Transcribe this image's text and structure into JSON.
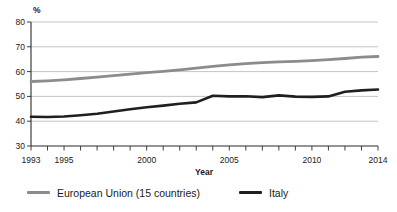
{
  "chart_data": {
    "type": "line",
    "title": "",
    "ylabel": "%",
    "xlabel": "Year",
    "ylim": [
      30,
      80
    ],
    "yticks": [
      30,
      40,
      50,
      60,
      70,
      80
    ],
    "xtick_labels": [
      1993,
      1995,
      2000,
      2005,
      2010,
      2014
    ],
    "grid": true,
    "legend_position": "bottom",
    "x": [
      1993,
      1994,
      1995,
      1996,
      1997,
      1998,
      1999,
      2000,
      2001,
      2002,
      2003,
      2004,
      2005,
      2006,
      2007,
      2008,
      2009,
      2010,
      2011,
      2012,
      2013,
      2014
    ],
    "series": [
      {
        "name": "European Union (15 countries)",
        "color": "#8c8c8c",
        "values": [
          56.0,
          56.3,
          56.7,
          57.2,
          57.8,
          58.4,
          59.0,
          59.6,
          60.1,
          60.7,
          61.4,
          62.1,
          62.7,
          63.2,
          63.6,
          63.9,
          64.1,
          64.4,
          64.8,
          65.3,
          65.8,
          66.1
        ]
      },
      {
        "name": "Italy",
        "color": "#1f1f1f",
        "values": [
          41.8,
          41.7,
          41.9,
          42.4,
          43.0,
          43.9,
          44.8,
          45.6,
          46.3,
          47.0,
          47.6,
          50.3,
          50.0,
          50.1,
          49.7,
          50.4,
          49.9,
          49.8,
          50.0,
          51.9,
          52.4,
          52.8
        ]
      }
    ],
    "colors": {
      "gridline": "#bdbdbd",
      "axis": "#2b2b2b",
      "text": "#1a1a1a"
    }
  }
}
